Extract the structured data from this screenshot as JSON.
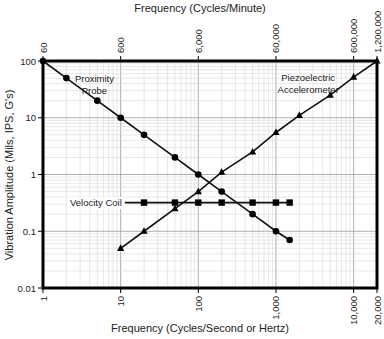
{
  "chart_data": {
    "type": "line",
    "scale": "log-log",
    "title": "",
    "xlabel": "Frequency (Cycles/Second or Hertz)",
    "x2label": "Frequency (Cycles/Minute)",
    "ylabel": "Vibration Amplitude (Mils, IPS, G's)",
    "xlim": [
      1,
      20000
    ],
    "ylim": [
      0.01,
      100
    ],
    "grid": true,
    "x_ticks": [
      {
        "value": 1,
        "label": "1"
      },
      {
        "value": 10,
        "label": "10"
      },
      {
        "value": 100,
        "label": "100"
      },
      {
        "value": 1000,
        "label": "1,000"
      },
      {
        "value": 10000,
        "label": "10,000"
      },
      {
        "value": 20000,
        "label": "20,000"
      }
    ],
    "x2_ticks": [
      {
        "value": 1,
        "label": "60"
      },
      {
        "value": 10,
        "label": "600"
      },
      {
        "value": 100,
        "label": "6,000"
      },
      {
        "value": 1000,
        "label": "60,000"
      },
      {
        "value": 10000,
        "label": "600,000"
      },
      {
        "value": 20000,
        "label": "1,200,000"
      }
    ],
    "y_ticks": [
      {
        "value": 100,
        "label": "100"
      },
      {
        "value": 10,
        "label": "10"
      },
      {
        "value": 1,
        "label": "1"
      },
      {
        "value": 0.1,
        "label": "0.1"
      },
      {
        "value": 0.01,
        "label": "0.01"
      }
    ],
    "series": [
      {
        "name": "Proximity Probe",
        "label_lines": [
          "Proximity",
          "Probe"
        ],
        "marker": "circle",
        "x": [
          1,
          2,
          5,
          10,
          20,
          50,
          100,
          200,
          500,
          1000,
          1500
        ],
        "y": [
          100,
          50,
          20,
          10,
          5,
          2,
          1,
          0.5,
          0.2,
          0.1,
          0.07
        ]
      },
      {
        "name": "Velocity Coil",
        "label_lines": [
          "Velocity Coil"
        ],
        "marker": "square",
        "x": [
          10,
          20,
          50,
          100,
          200,
          500,
          1000,
          1500
        ],
        "y": [
          0.32,
          0.32,
          0.32,
          0.32,
          0.32,
          0.32,
          0.32,
          0.32
        ]
      },
      {
        "name": "Piezoelectric Accelerometer",
        "label_lines": [
          "Piezoelectric",
          "Accelerometer"
        ],
        "marker": "triangle",
        "x": [
          10,
          20,
          50,
          100,
          200,
          500,
          1000,
          2000,
          5000,
          10000,
          20000
        ],
        "y": [
          0.05,
          0.1,
          0.25,
          0.5,
          1.1,
          2.5,
          5.5,
          11,
          25,
          52,
          100
        ]
      }
    ],
    "annotations": [
      {
        "text": "Proximity",
        "x": 4.6,
        "y": 50
      },
      {
        "text": "Probe",
        "x": 4.6,
        "y": 30
      },
      {
        "text": "Piezoelectric",
        "x": 2600,
        "y": 52
      },
      {
        "text": "Accelerometer",
        "x": 2600,
        "y": 31
      },
      {
        "text": "Velocity Coil",
        "x": 4.8,
        "y": 0.32
      }
    ],
    "colors": {
      "line": "#111111",
      "grid_minor": "#d6d6d6",
      "grid_major": "#9a9a9a",
      "frame": "#000000"
    }
  }
}
